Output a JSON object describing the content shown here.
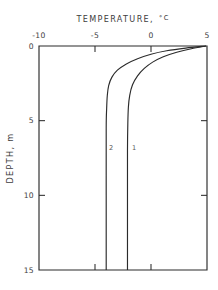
{
  "chart_data": {
    "type": "line",
    "title_text": "TEMPERATURE,",
    "title_unit": "°C",
    "xlabel": "TEMPERATURE, °C",
    "ylabel": "DEPTH, m",
    "ylabel_text": "DEPTH, m",
    "x_axis_position": "top",
    "y_axis_direction": "inverted",
    "xlim": [
      -10,
      5
    ],
    "ylim": [
      0,
      15
    ],
    "xticks": [
      -10,
      -5,
      0,
      5
    ],
    "xtick_labels": [
      "-10",
      "-5",
      "0",
      "5"
    ],
    "yticks": [
      0,
      5,
      10,
      15
    ],
    "ytick_labels": [
      "0",
      "5",
      "10",
      "15"
    ],
    "grid": false,
    "legend": "inline-curve-labels",
    "series": [
      {
        "name": "1",
        "label": "1",
        "label_x": -2.05,
        "label_y": 6.95,
        "asymptote_temperature": -2.1,
        "surface_temperature": 4.9,
        "points": [
          {
            "t": 4.9,
            "d": 0.0
          },
          {
            "t": 3.6,
            "d": 0.18
          },
          {
            "t": 2.3,
            "d": 0.42
          },
          {
            "t": 1.1,
            "d": 0.72
          },
          {
            "t": 0.15,
            "d": 1.08
          },
          {
            "t": -0.6,
            "d": 1.5
          },
          {
            "t": -1.2,
            "d": 2.0
          },
          {
            "t": -1.65,
            "d": 2.6
          },
          {
            "t": -1.9,
            "d": 3.3
          },
          {
            "t": -2.02,
            "d": 4.1
          },
          {
            "t": -2.07,
            "d": 5.2
          },
          {
            "t": -2.1,
            "d": 7.0
          },
          {
            "t": -2.1,
            "d": 10.0
          },
          {
            "t": -2.1,
            "d": 15.0
          }
        ]
      },
      {
        "name": "2",
        "label": "2",
        "label_x": -4.1,
        "label_y": 6.95,
        "asymptote_temperature": -4.0,
        "surface_temperature": 4.9,
        "points": [
          {
            "t": 4.9,
            "d": 0.0
          },
          {
            "t": 3.1,
            "d": 0.14
          },
          {
            "t": 1.4,
            "d": 0.32
          },
          {
            "t": 0.0,
            "d": 0.55
          },
          {
            "t": -1.2,
            "d": 0.85
          },
          {
            "t": -2.2,
            "d": 1.2
          },
          {
            "t": -3.0,
            "d": 1.62
          },
          {
            "t": -3.5,
            "d": 2.1
          },
          {
            "t": -3.78,
            "d": 2.65
          },
          {
            "t": -3.9,
            "d": 3.3
          },
          {
            "t": -3.96,
            "d": 4.2
          },
          {
            "t": -4.0,
            "d": 5.5
          },
          {
            "t": -4.0,
            "d": 10.0
          },
          {
            "t": -4.0,
            "d": 15.0
          }
        ]
      }
    ]
  },
  "axes": {
    "x_title": "TEMPERATURE,",
    "x_unit": "°C",
    "y_title": "DEPTH, m"
  },
  "ticks": {
    "x": [
      {
        "label": "-10",
        "value": -10
      },
      {
        "label": "-5",
        "value": -5
      },
      {
        "label": "0",
        "value": 0
      },
      {
        "label": "5",
        "value": 5
      }
    ],
    "y": [
      {
        "label": "0",
        "value": 0
      },
      {
        "label": "5",
        "value": 5
      },
      {
        "label": "10",
        "value": 10
      },
      {
        "label": "15",
        "value": 15
      }
    ]
  },
  "colors": {
    "line": "#2b2b2b",
    "text": "#3d3d3d",
    "background": "#ffffff"
  }
}
